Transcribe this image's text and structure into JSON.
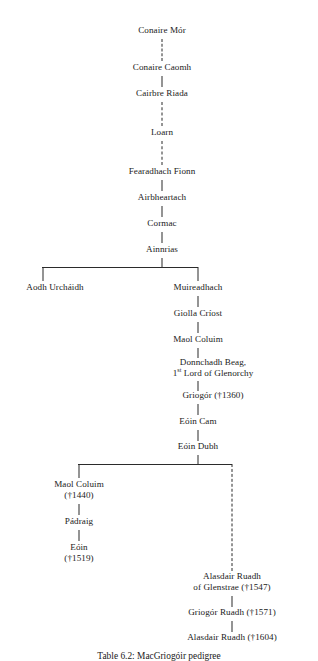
{
  "diagram": {
    "type": "genealogical-tree",
    "caption": "Table 6.2: MacGriogóir pedigree",
    "trunk_x": 162,
    "right_column_x": 232,
    "left_branch_x": 55,
    "nodes": [
      {
        "id": "conaire-mor",
        "label": "Conaire Mór"
      },
      {
        "id": "conaire-caomh",
        "label": "Conaire Caomh"
      },
      {
        "id": "cairbre-riada",
        "label": "Cairbre Riada"
      },
      {
        "id": "loarn",
        "label": "Loarn"
      },
      {
        "id": "fearadhach-fionn",
        "label": "Fearadhach Fionn"
      },
      {
        "id": "airbheartach",
        "label": "Airbheartach"
      },
      {
        "id": "cormac",
        "label": "Cormac"
      },
      {
        "id": "ainnrias",
        "label": "Ainnrias"
      },
      {
        "id": "aodh-urchaidh",
        "label": "Aodh Urcháidh"
      },
      {
        "id": "muireadhach",
        "label": "Muireadhach"
      },
      {
        "id": "giolla-criost",
        "label": "Giolla Críost"
      },
      {
        "id": "maol-coluim-1",
        "label": "Maol Coluim"
      },
      {
        "id": "donnchadh-beag",
        "label_line1": "Donnchadh Beag,",
        "label_line2_pre": "1",
        "label_line2_sup": "st",
        "label_line2_post": " Lord of Glenorchy"
      },
      {
        "id": "griogor-1360",
        "label": "Griogór (†1360)"
      },
      {
        "id": "eoin-cam",
        "label": "Eóin Cam"
      },
      {
        "id": "eoin-dubh",
        "label": "Eóin Dubh"
      },
      {
        "id": "maol-coluim-2",
        "label_line1": "Maol Coluim",
        "label_line2": "(†1440)"
      },
      {
        "id": "padraig",
        "label": "Pádraig"
      },
      {
        "id": "eoin-1519",
        "label_line1": "Eóin",
        "label_line2": "(†1519)"
      },
      {
        "id": "alasdair-ruadh-1547",
        "label_line1": "Alasdair Ruadh",
        "label_line2": "of Glenstrae (†1547)"
      },
      {
        "id": "griogor-ruadh-1571",
        "label": "Griogór Ruadh (†1571)"
      },
      {
        "id": "alasdair-ruadh-1604",
        "label": "Alasdair Ruadh (†1604)"
      }
    ]
  }
}
